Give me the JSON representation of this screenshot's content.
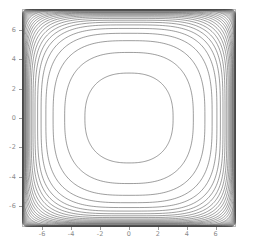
{
  "figure": {
    "background": "#ffffff",
    "axes_color": "#b9b9b9",
    "tick_color": "#9a9a9a",
    "ticklabel_color": "#8a8a8a",
    "contour_color": "#4d4d4d"
  },
  "chart_data": {
    "type": "contour",
    "title": "",
    "xlabel": "",
    "ylabel": "",
    "xlim": [
      -7.4,
      7.4
    ],
    "ylim": [
      -7.4,
      7.4
    ],
    "xticks": [
      -6,
      -4,
      -2,
      0,
      2,
      4,
      6
    ],
    "xticklabels": [
      "-6",
      "-4",
      "-2",
      "0",
      "2",
      "4",
      "6"
    ],
    "yticks": [
      -6,
      -4,
      -2,
      0,
      2,
      4,
      6
    ],
    "yticklabels": [
      "-6",
      "-4",
      "-2",
      "0",
      "2",
      "4",
      "6"
    ],
    "grid": false,
    "legend": null,
    "colormap": "grayscale-lines",
    "line_color": "#4d4d4d",
    "symmetry": "4-fold (square symmetric, even in x and y)",
    "n_levels": 18,
    "levels": [
      0.1,
      0.16,
      0.22,
      0.28,
      0.34,
      0.4,
      0.46,
      0.52,
      0.58,
      0.64,
      0.7,
      0.76,
      0.82,
      0.88,
      0.91,
      0.94,
      0.965,
      0.985
    ],
    "rings": [
      {
        "level": 0.1,
        "half_extent": 3.05,
        "exponent": 2.45
      },
      {
        "level": 0.16,
        "half_extent": 4.45,
        "exponent": 2.7
      },
      {
        "level": 0.22,
        "half_extent": 5.25,
        "exponent": 2.95
      },
      {
        "level": 0.28,
        "half_extent": 5.75,
        "exponent": 3.2
      },
      {
        "level": 0.34,
        "half_extent": 6.08,
        "exponent": 3.45
      },
      {
        "level": 0.4,
        "half_extent": 6.32,
        "exponent": 3.7
      },
      {
        "level": 0.46,
        "half_extent": 6.5,
        "exponent": 3.95
      },
      {
        "level": 0.52,
        "half_extent": 6.64,
        "exponent": 4.25
      },
      {
        "level": 0.58,
        "half_extent": 6.76,
        "exponent": 4.55
      },
      {
        "level": 0.64,
        "half_extent": 6.86,
        "exponent": 4.9
      },
      {
        "level": 0.7,
        "half_extent": 6.94,
        "exponent": 5.3
      },
      {
        "level": 0.76,
        "half_extent": 7.01,
        "exponent": 5.75
      },
      {
        "level": 0.82,
        "half_extent": 7.07,
        "exponent": 6.3
      },
      {
        "level": 0.88,
        "half_extent": 7.12,
        "exponent": 6.95
      },
      {
        "level": 0.91,
        "half_extent": 7.16,
        "exponent": 7.7
      },
      {
        "level": 0.94,
        "half_extent": 7.2,
        "exponent": 8.6
      },
      {
        "level": 0.965,
        "half_extent": 7.24,
        "exponent": 9.7
      },
      {
        "level": 0.985,
        "half_extent": 7.28,
        "exponent": 11.0
      }
    ]
  }
}
